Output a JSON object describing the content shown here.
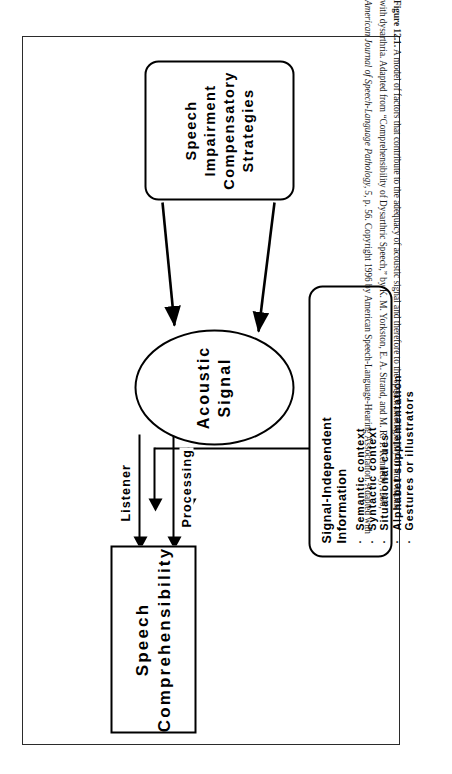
{
  "figure": {
    "caption_lines": [
      "Figure 12.1.  A model of factors that contribute to the adequacy of acoustic signal and therefore to the speech intelligibility of individuals",
      "with dysarthria. Adapted from “Comprehensibility of Dysarthric Speech,” by K. M. Yorkston, E. A. Strand, and M. R. T. Kennedy, 1996,",
      "American Journal of Speech-Language Pathology, 5, p. 56. Copyright 1996 by American Speech-Language-Hearing Association. Adapted with"
    ],
    "caption_label": "Figure 12.1.",
    "border_color": "#2b2b2b"
  },
  "diagram": {
    "nodes": {
      "speech_comprehensibility": {
        "line1": "Speech",
        "line2": "Comprehensibility"
      },
      "acoustic_signal": {
        "line1": "Acoustic",
        "line2": "Signal"
      },
      "speech_impairment": {
        "line1": "Speech",
        "line2": "Impairment",
        "line3": "Compensatory",
        "line4": "Strategies"
      },
      "signal_independent": {
        "title_line1": "Signal-Independent",
        "title_line2": "Information",
        "bullets": [
          "Semantic  context",
          "Syntactic  context",
          "Situational  cues",
          "Alphabet  supplementation",
          "Gestures  or  illustrators"
        ],
        "bullet_glyph": "·"
      }
    },
    "edges": {
      "listener_label": "Listener",
      "processing_label": "Processing"
    }
  }
}
